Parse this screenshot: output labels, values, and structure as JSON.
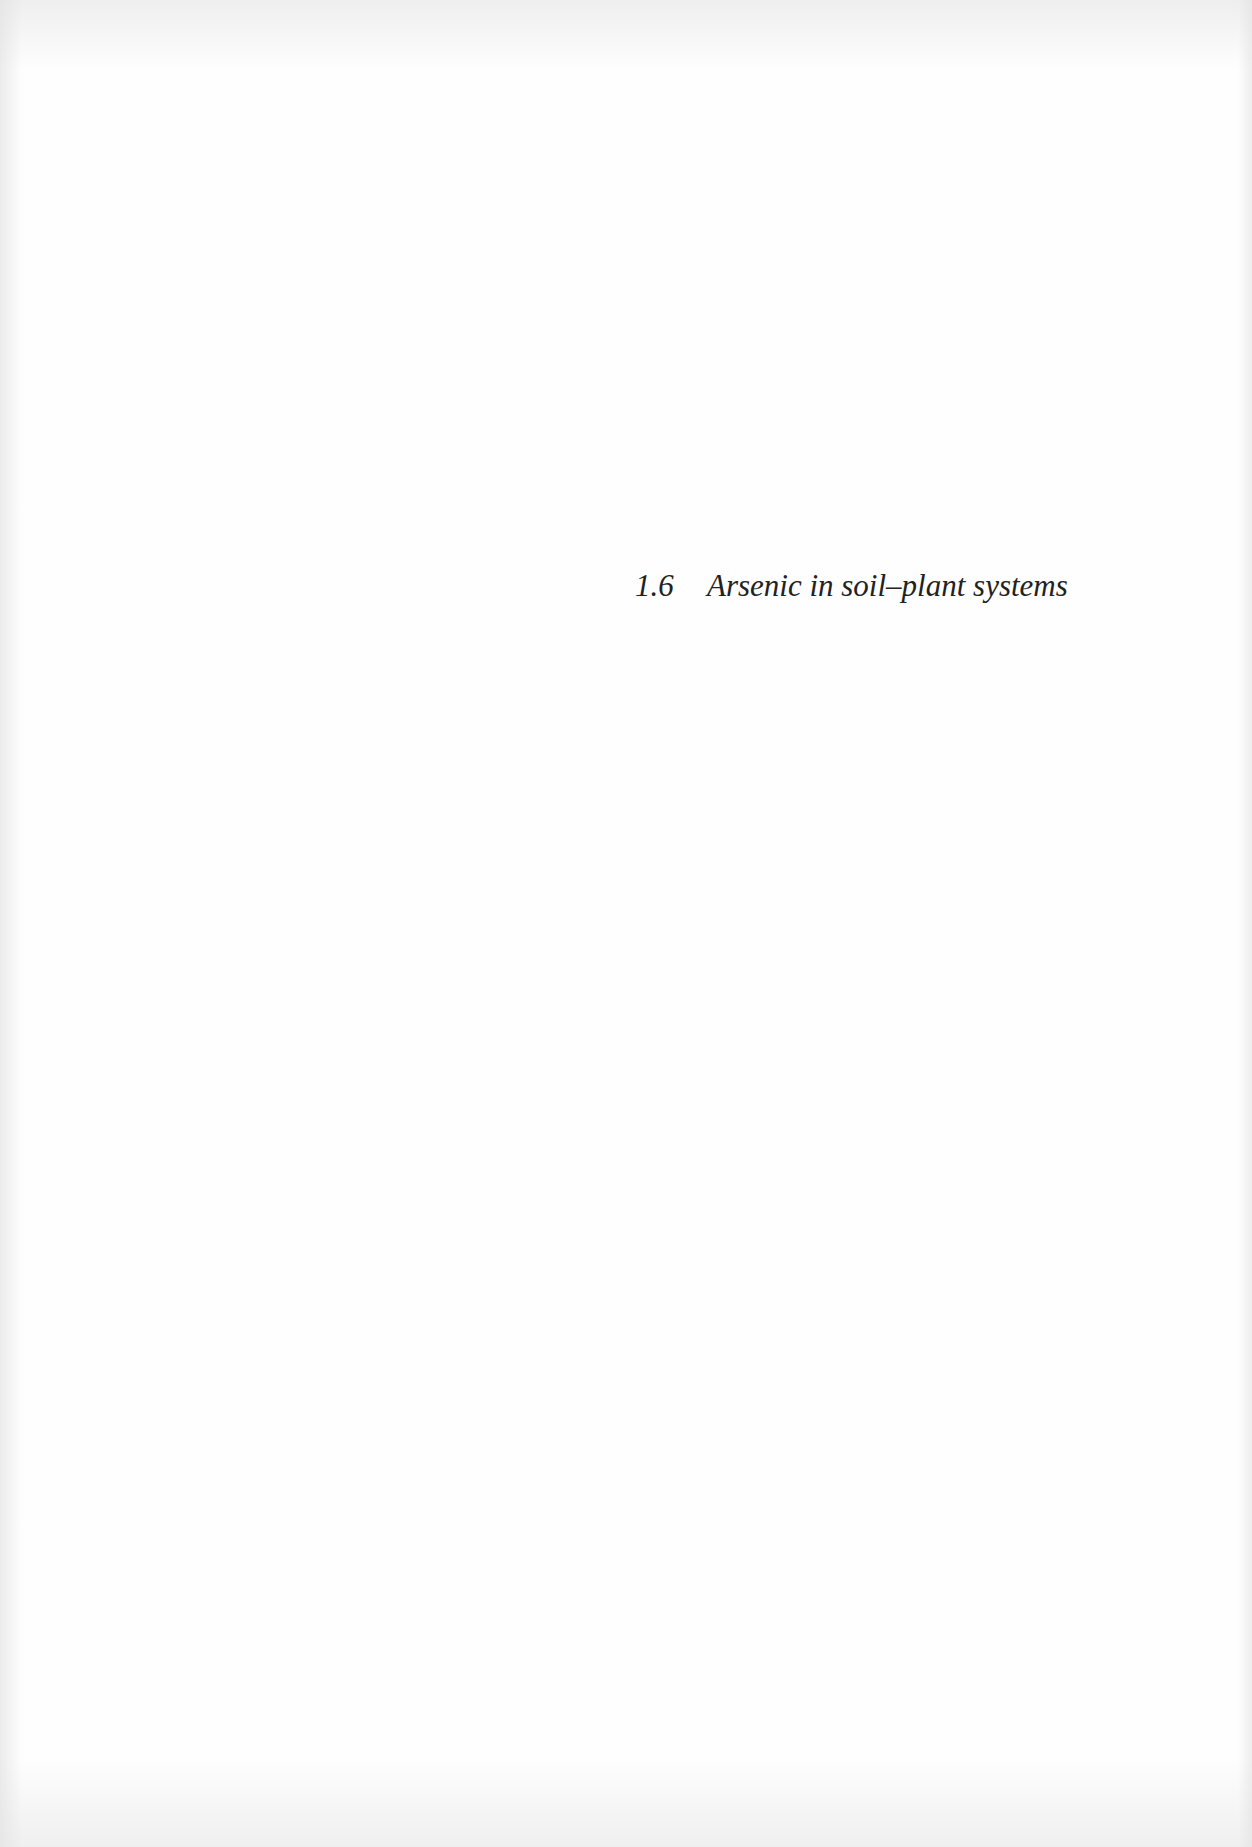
{
  "page": {
    "background_color": "#fefefe",
    "text_color": "#222222"
  },
  "heading": {
    "number": "1.6",
    "title": "Arsenic in soil–plant systems"
  }
}
